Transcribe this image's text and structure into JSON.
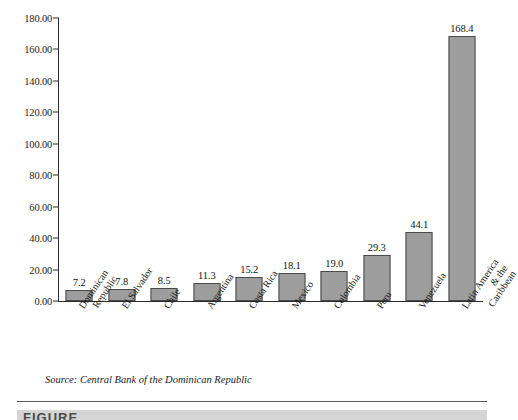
{
  "chart_data": {
    "type": "bar",
    "title": "",
    "xlabel": "",
    "ylabel": "",
    "ylim": [
      0,
      180
    ],
    "grid": false,
    "legend": "none",
    "ytick_labels": [
      "180.00",
      "160.00",
      "140.00",
      "120.00",
      "100.00",
      "80.00",
      "60.00",
      "40.00",
      "20.00",
      "0.00"
    ],
    "ytick_values": [
      180,
      160,
      140,
      120,
      100,
      80,
      60,
      40,
      20,
      0
    ],
    "categories": [
      "Dominican Republic",
      "El Salvador",
      "Chile",
      "Argentina",
      "Costa Rica",
      "Mexico",
      "Colombia",
      "Peru",
      "Venezuela",
      "Latin America & the Caribbean"
    ],
    "category_lines": [
      [
        "Dominican",
        "Republic"
      ],
      [
        "El Salvador"
      ],
      [
        "Chile"
      ],
      [
        "Argentina"
      ],
      [
        "Costa Rica"
      ],
      [
        "Mexico"
      ],
      [
        "Colombia"
      ],
      [
        "Peru"
      ],
      [
        "Venezuela"
      ],
      [
        "Latin America",
        "& the",
        "Caribbean"
      ]
    ],
    "values": [
      7.2,
      7.8,
      8.5,
      11.3,
      15.2,
      18.1,
      19.0,
      29.3,
      44.1,
      168.4
    ],
    "value_labels": [
      "7.2",
      "7.8",
      "8.5",
      "11.3",
      "15.2",
      "18.1",
      "19.0",
      "29.3",
      "44.1",
      "168.4"
    ],
    "bar_color": "#9d9d9d",
    "bar_border_color": "#4a4a4a",
    "axis_color": "#2b2b2b"
  },
  "caption": {
    "source": "Source: Central Bank of the Dominican Republic"
  },
  "footer": {
    "figure_label": "FIGURE"
  }
}
